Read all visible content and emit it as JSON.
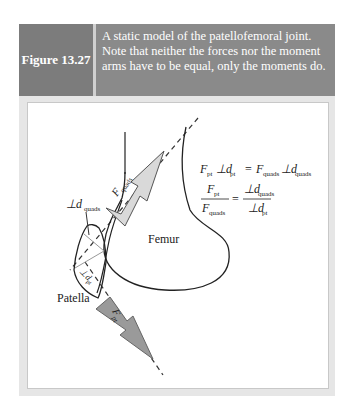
{
  "figure": {
    "label": "Figure 13.27",
    "caption": "A static model of the patellofemoral joint. Note that neither the forces nor the moment arms have to be equal, only the moments do."
  },
  "diagram": {
    "labels": {
      "femur": "Femur",
      "patella": "Patella",
      "f_quads": "F",
      "f_quads_sub": "quads",
      "f_pt": "F",
      "f_pt_sub": "pt",
      "d_quads": "⊥d",
      "d_quads_sub": "quads",
      "d_pt": "⊥d",
      "d_pt_sub": "pt"
    },
    "equations": {
      "eq1_lhs_F": "F",
      "eq1_lhs_F_sub": "pt",
      "eq1_lhs_d": "⊥d",
      "eq1_lhs_d_sub": "pt",
      "eq1_eq": "=",
      "eq1_rhs_F": "F",
      "eq1_rhs_F_sub": "quads",
      "eq1_rhs_d": "⊥d",
      "eq1_rhs_d_sub": "quads",
      "eq2_num_F": "F",
      "eq2_num_F_sub": "pt",
      "eq2_den_F": "F",
      "eq2_den_F_sub": "quads",
      "eq2_eq": "=",
      "eq2_num_d": "⊥d",
      "eq2_num_d_sub": "quads",
      "eq2_den_d": "⊥d",
      "eq2_den_d_sub": "pt"
    },
    "colors": {
      "header_bg": "#8a8a8a",
      "label_bg": "#7c7c7c",
      "quads_arrow": "#d9d9d9",
      "pt_arrow": "#9a9a9a"
    }
  }
}
